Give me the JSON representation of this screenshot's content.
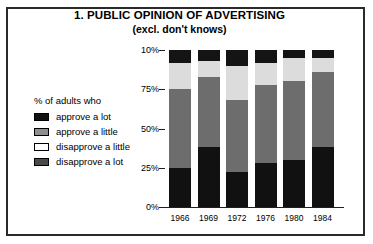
{
  "chart_data": {
    "type": "bar",
    "subtype": "stacked-bar-100-percent",
    "title": "1. PUBLIC OPINION OF ADVERTISING",
    "subtitle": "(excl. don't knows)",
    "legend_heading": "% of adults who",
    "legend_position": "left",
    "xlabel": "",
    "ylabel": "",
    "grid": false,
    "categories": [
      "1966",
      "1969",
      "1972",
      "1976",
      "1980",
      "1984"
    ],
    "ylim": [
      0,
      100
    ],
    "yticks": [
      0,
      25,
      50,
      75,
      100
    ],
    "ytick_labels": [
      "0%",
      "25%",
      "50%",
      "75%",
      "10%"
    ],
    "series": [
      {
        "name": "approve a lot",
        "color": "#111111",
        "values": [
          25,
          38,
          22,
          28,
          30,
          38
        ]
      },
      {
        "name": "approve a little",
        "color": "#6d6d6d",
        "values": [
          50,
          45,
          46,
          50,
          50,
          48
        ]
      },
      {
        "name": "disapprove a little",
        "color": "#dcdcdc",
        "values": [
          17,
          10,
          22,
          14,
          15,
          9
        ]
      },
      {
        "name": "disapprove a lot",
        "color": "#141414",
        "values": [
          8,
          7,
          10,
          8,
          5,
          5
        ]
      }
    ]
  },
  "legend": {
    "heading": "% of adults who",
    "items": [
      {
        "label": "approve a lot",
        "swatch_class": "sw-approve-lot"
      },
      {
        "label": "approve a little",
        "swatch_class": "sw-approve-little"
      },
      {
        "label": "disapprove a little",
        "swatch_class": "sw-disapprove-little"
      },
      {
        "label": "disapprove a lot",
        "swatch_class": "sw-disapprove-lot"
      }
    ]
  }
}
